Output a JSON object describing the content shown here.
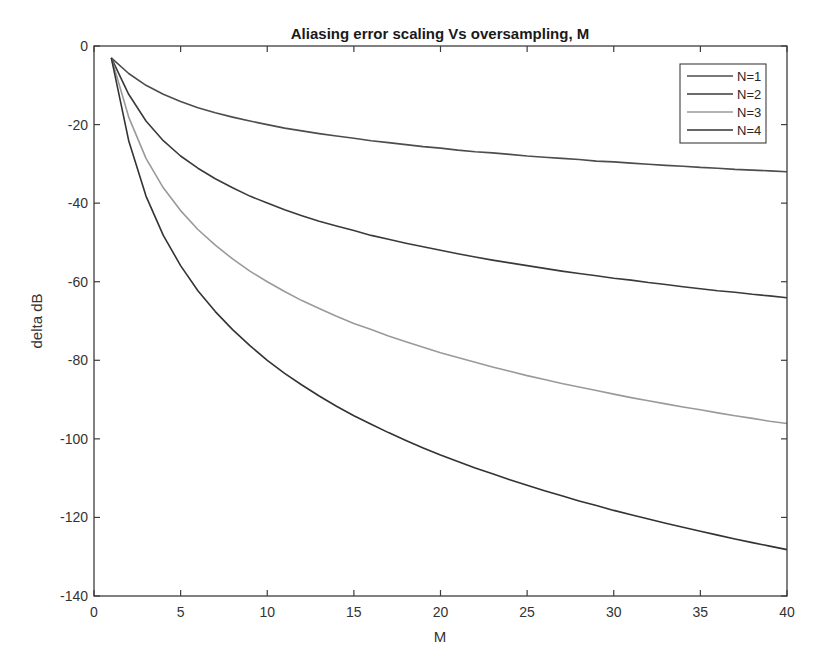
{
  "chart_data": {
    "type": "line",
    "title": "Aliasing error scaling Vs oversampling, M",
    "xlabel": "M",
    "ylabel": "delta dB",
    "xlim": [
      0,
      40
    ],
    "ylim": [
      -140,
      0
    ],
    "xticks": [
      0,
      5,
      10,
      15,
      20,
      25,
      30,
      35,
      40
    ],
    "yticks": [
      0,
      -20,
      -40,
      -60,
      -80,
      -100,
      -120,
      -140
    ],
    "grid": false,
    "legend_position": "top-right",
    "x": [
      1,
      2,
      3,
      4,
      5,
      6,
      7,
      8,
      9,
      10,
      11,
      12,
      13,
      14,
      15,
      16,
      17,
      18,
      19,
      20,
      21,
      22,
      23,
      24,
      25,
      26,
      27,
      28,
      29,
      30,
      31,
      32,
      33,
      34,
      35,
      36,
      37,
      38,
      39,
      40
    ],
    "series": [
      {
        "name": "N=1",
        "color": "#4d4d4d",
        "values": [
          -3.0,
          -7.0,
          -10.0,
          -12.3,
          -14.1,
          -15.7,
          -17.0,
          -18.1,
          -19.1,
          -20.0,
          -20.9,
          -21.6,
          -22.3,
          -22.9,
          -23.5,
          -24.1,
          -24.6,
          -25.1,
          -25.6,
          -26.0,
          -26.5,
          -26.9,
          -27.2,
          -27.6,
          -28.0,
          -28.3,
          -28.6,
          -28.9,
          -29.3,
          -29.5,
          -29.8,
          -30.1,
          -30.4,
          -30.6,
          -30.9,
          -31.1,
          -31.4,
          -31.6,
          -31.8,
          -32.0
        ]
      },
      {
        "name": "N=2",
        "color": "#3a3a3a",
        "values": [
          -3.0,
          -12.3,
          -19.1,
          -24.1,
          -28.0,
          -31.1,
          -33.8,
          -36.1,
          -38.2,
          -40.0,
          -41.7,
          -43.2,
          -44.6,
          -45.8,
          -47.0,
          -48.2,
          -49.2,
          -50.2,
          -51.1,
          -52.0,
          -52.9,
          -53.7,
          -54.5,
          -55.2,
          -55.9,
          -56.6,
          -57.3,
          -57.9,
          -58.5,
          -59.1,
          -59.6,
          -60.2,
          -60.7,
          -61.3,
          -61.8,
          -62.3,
          -62.7,
          -63.2,
          -63.6,
          -64.1
        ]
      },
      {
        "name": "N=3",
        "color": "#9a9a9a",
        "values": [
          -3.0,
          -18.1,
          -28.6,
          -36.1,
          -41.9,
          -46.7,
          -50.7,
          -54.2,
          -57.3,
          -60.0,
          -62.5,
          -64.8,
          -66.8,
          -68.8,
          -70.6,
          -72.2,
          -73.8,
          -75.3,
          -76.7,
          -78.1,
          -79.3,
          -80.5,
          -81.7,
          -82.8,
          -83.9,
          -84.9,
          -85.9,
          -86.8,
          -87.7,
          -88.6,
          -89.5,
          -90.3,
          -91.1,
          -91.9,
          -92.6,
          -93.4,
          -94.1,
          -94.8,
          -95.5,
          -96.1
        ]
      },
      {
        "name": "N=4",
        "color": "#333333",
        "values": [
          -3.0,
          -24.1,
          -38.2,
          -48.2,
          -55.9,
          -62.3,
          -67.6,
          -72.2,
          -76.3,
          -80.0,
          -83.3,
          -86.3,
          -89.1,
          -91.7,
          -94.1,
          -96.3,
          -98.4,
          -100.4,
          -102.3,
          -104.1,
          -105.8,
          -107.4,
          -108.9,
          -110.4,
          -111.8,
          -113.2,
          -114.5,
          -115.8,
          -117.0,
          -118.2,
          -119.3,
          -120.4,
          -121.5,
          -122.5,
          -123.5,
          -124.5,
          -125.5,
          -126.4,
          -127.3,
          -128.2
        ]
      }
    ]
  }
}
